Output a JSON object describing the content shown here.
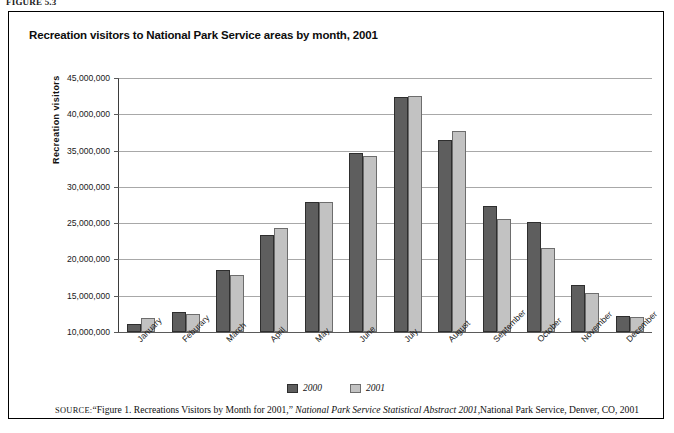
{
  "figure_label": "FIGURE 5.3",
  "chart_title": "Recreation visitors to National Park Service areas by month, 2001",
  "legend": {
    "items": [
      {
        "label": "2000",
        "color": "#5e5e5e"
      },
      {
        "label": "2001",
        "color": "#c2c2c2"
      }
    ]
  },
  "source": {
    "prefix": "SOURCE:",
    "part1": "“Figure 1. Recreations Visitors by Month for 2001,” ",
    "italic": "National Park Service Statistical Abstract 2001",
    "part2": ",National Park Service, Denver, CO, 2001"
  },
  "chart_data": {
    "type": "bar",
    "title": "Recreation visitors to National Park Service areas by month, 2001",
    "xlabel": "",
    "ylabel": "Recreation  visitors",
    "ylim": [
      10000000,
      45000000
    ],
    "ytick_labels": [
      "45,000,000",
      "40,000,000",
      "35,000,000",
      "30,000,000",
      "25,000,000",
      "20,000,000",
      "15,000,000",
      "10,000,000"
    ],
    "yticks": [
      45000000,
      40000000,
      35000000,
      30000000,
      25000000,
      20000000,
      15000000,
      10000000
    ],
    "grid": true,
    "legend_position": "bottom-center",
    "categories": [
      "January",
      "Feburary",
      "March",
      "April",
      "May",
      "June",
      "July",
      "August",
      "September",
      "October",
      "November",
      "December"
    ],
    "series": [
      {
        "name": "2000",
        "color": "#5e5e5e",
        "values": [
          11100000,
          12800000,
          18600000,
          23300000,
          27900000,
          34700000,
          42400000,
          36500000,
          27400000,
          25100000,
          16500000,
          12200000
        ]
      },
      {
        "name": "2001",
        "color": "#c2c2c2",
        "values": [
          11900000,
          12500000,
          17900000,
          24300000,
          27900000,
          34200000,
          42500000,
          37700000,
          25600000,
          21600000,
          15400000,
          12100000
        ]
      }
    ]
  }
}
